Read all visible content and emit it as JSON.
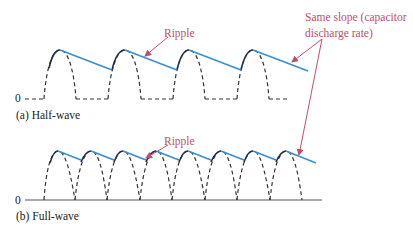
{
  "figure": {
    "panel_a": {
      "caption": "(a) Half-wave",
      "zero_label": "0",
      "annotation": "Ripple"
    },
    "panel_b": {
      "caption": "(b) Full-wave",
      "zero_label": "0",
      "annotation": "Ripple"
    },
    "shared_annotation": {
      "line1": "Same slope (capacitor",
      "line2": "discharge rate)"
    },
    "colors": {
      "ripple_line": "#3b8fd4",
      "annotation": "#c0506a",
      "waveform": "#333333",
      "axis": "#555555"
    }
  }
}
